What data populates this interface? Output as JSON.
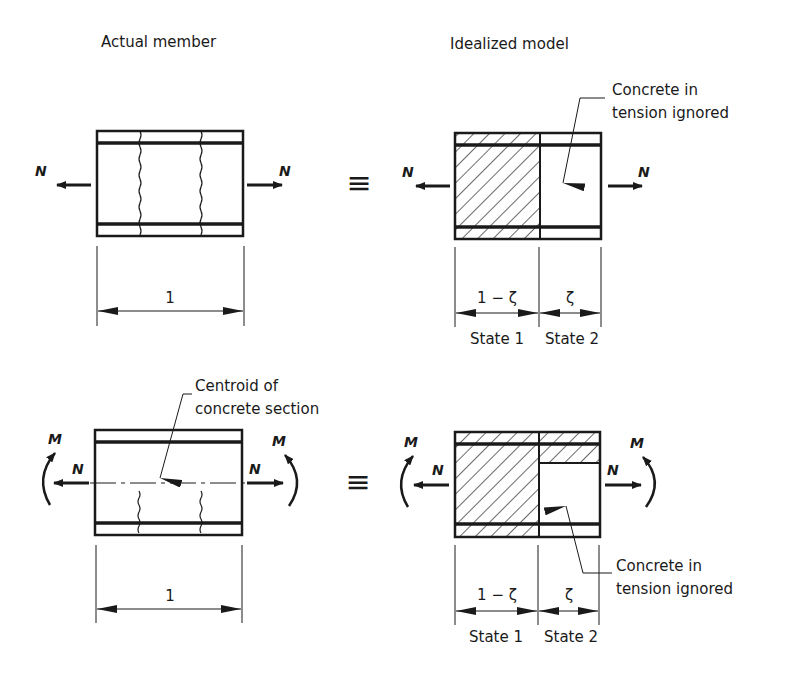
{
  "headers": {
    "left": "Actual member",
    "right": "Idealized model"
  },
  "equivalence_symbol": "≡",
  "top_row": {
    "load_case": "axial tension",
    "forces": {
      "left": "N",
      "right": "N"
    },
    "actual": {
      "dimension": "1"
    },
    "idealized": {
      "annotation": [
        "Concrete in",
        "tension ignored"
      ],
      "dimensions": {
        "state1": "1 − ζ",
        "state2": "ζ"
      },
      "state_labels": {
        "state1": "State 1",
        "state2": "State 2"
      }
    }
  },
  "bottom_row": {
    "load_case": "axial tension plus bending",
    "forces": {
      "left_N": "N",
      "right_N": "N",
      "left_M": "M",
      "right_M": "M"
    },
    "actual": {
      "annotation": [
        "Centroid of",
        "concrete section"
      ],
      "dimension": "1"
    },
    "idealized": {
      "annotation": [
        "Concrete in",
        "tension ignored"
      ],
      "dimensions": {
        "state1": "1 − ζ",
        "state2": "ζ"
      },
      "state_labels": {
        "state1": "State 1",
        "state2": "State 2"
      }
    }
  },
  "colors": {
    "ink": "#1a1a1a",
    "background": "#ffffff"
  }
}
